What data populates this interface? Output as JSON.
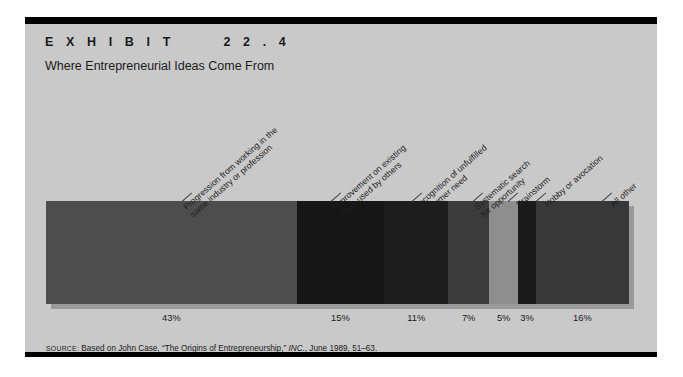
{
  "exhibit": {
    "label": "E X H I B I T      2 2 . 4",
    "title": "Where Entrepreneurial Ideas Come From",
    "panel_bg": "#c9c9c9",
    "rule_color": "#000000"
  },
  "source": {
    "prefix": "SOURCE:",
    "text_before": " Based on John Case, “The Origins of Entrepreneurship,” ",
    "italic": "INC.",
    "text_after": ", June 1989, 51–63."
  },
  "chart_data": {
    "type": "bar",
    "orientation": "horizontal-stacked",
    "title": "Where Entrepreneurial Ideas Come From",
    "subtitle": "",
    "xlabel": "",
    "ylabel": "",
    "grid": false,
    "legend": "none",
    "total": 100,
    "categories": [
      "Progression from working in the same industry or profession",
      "Improvement on existing ideas used by others",
      "Recognition of unfulfilled consumer need",
      "Systematic search for opportunity",
      "Brainstorm",
      "Hobby or avocation",
      "All other"
    ],
    "values": [
      43,
      15,
      11,
      7,
      5,
      3,
      16
    ],
    "value_labels": [
      "43%",
      "15%",
      "11%",
      "7%",
      "5%",
      "3%",
      "16%"
    ],
    "colors": [
      "#4d4d4d",
      "#161616",
      "#1d1d1d",
      "#3b3b3b",
      "#8e8e8e",
      "#1a1a1a",
      "#383838"
    ],
    "segments": [
      {
        "label_lines": [
          "Progression from working in the",
          "same industry or profession"
        ],
        "value": 43,
        "value_label": "43%",
        "color": "#4d4d4d"
      },
      {
        "label_lines": [
          "Improvement on existing",
          "ideas used by others"
        ],
        "value": 15,
        "value_label": "15%",
        "color": "#161616"
      },
      {
        "label_lines": [
          "Recognition of unfulfilled",
          "consumer need"
        ],
        "value": 11,
        "value_label": "11%",
        "color": "#1d1d1d"
      },
      {
        "label_lines": [
          "Systematic search",
          "for opportunity"
        ],
        "value": 7,
        "value_label": "7%",
        "color": "#3b3b3b"
      },
      {
        "label_lines": [
          "Brainstorm"
        ],
        "value": 5,
        "value_label": "5%",
        "color": "#8e8e8e"
      },
      {
        "label_lines": [
          "Hobby or avocation"
        ],
        "value": 3,
        "value_label": "3%",
        "color": "#1a1a1a"
      },
      {
        "label_lines": [
          "All other"
        ],
        "value": 16,
        "value_label": "16%",
        "color": "#383838"
      }
    ]
  }
}
